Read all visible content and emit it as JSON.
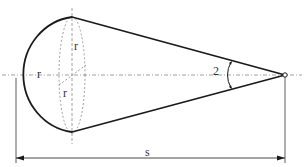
{
  "diagram": {
    "type": "technical drawing",
    "labels": {
      "radius_horizontal": "r",
      "radius_vertical": "r",
      "radius_oblique": "r",
      "half_angle": "2",
      "length": "s"
    },
    "colors": {
      "outline": "#1a1a1a",
      "construction": "#888888",
      "dimension": "#333333"
    }
  }
}
